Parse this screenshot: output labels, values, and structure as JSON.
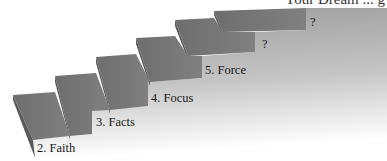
{
  "title": "Your Dream ... g",
  "steps": [
    {
      "label": "2. Faith"
    },
    {
      "label": "3. Facts"
    },
    {
      "label": "4. Focus"
    },
    {
      "label": "5. Force"
    },
    {
      "label": "?"
    },
    {
      "label": "?"
    }
  ],
  "colors": {
    "tread": "#7a7a7a",
    "side": "#5e5e5e",
    "face_top": "#9a9a9a",
    "face_bottom": "#ffffff"
  }
}
